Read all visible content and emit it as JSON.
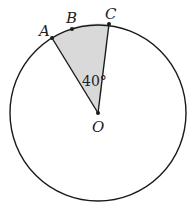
{
  "diagram": {
    "type": "circle-sector",
    "center": {
      "label": "O"
    },
    "points": [
      {
        "label": "A"
      },
      {
        "label": "B"
      },
      {
        "label": "C"
      }
    ],
    "angle_label": "40°",
    "shaded_region": "sector AOC",
    "colors": {
      "stroke": "#1a1a1a",
      "shade": "#d9d9d9",
      "background": "#ffffff"
    }
  }
}
